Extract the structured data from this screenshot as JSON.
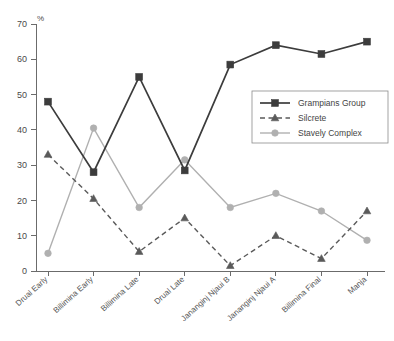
{
  "chart_data": {
    "type": "line",
    "title": "",
    "xlabel": "",
    "ylabel": "%",
    "ylim": [
      0,
      70
    ],
    "yticks": [
      0,
      10,
      20,
      30,
      40,
      50,
      60,
      70
    ],
    "grid": false,
    "legend_position": "center-right",
    "categories": [
      "Drual Early",
      "Billimina Early",
      "Billimina Late",
      "Drual Late",
      "Jananginj Njaui B",
      "Jananginj Njaui A",
      "Billimina Final",
      "Manja"
    ],
    "series": [
      {
        "name": "Grampians Group",
        "color": "#3c3c3c",
        "marker": "square",
        "dash": "solid",
        "values": [
          48,
          28,
          55,
          28.5,
          58.5,
          64,
          61.5,
          65
        ]
      },
      {
        "name": "Silcrete",
        "color": "#5a5a5a",
        "marker": "triangle",
        "dash": "dashed",
        "values": [
          33,
          20.5,
          5.5,
          15,
          1.5,
          10,
          3.5,
          17
        ]
      },
      {
        "name": "Stavely Complex",
        "color": "#b0b0b0",
        "marker": "circle",
        "dash": "solid",
        "values": [
          5,
          40.5,
          18,
          31.5,
          18,
          22,
          17,
          8.7
        ]
      }
    ]
  },
  "axis": {
    "unit_label": "%",
    "y_tick_labels": [
      "70",
      "60",
      "50",
      "40",
      "30",
      "20",
      "10",
      "0"
    ]
  },
  "legend": {
    "entries": [
      {
        "label": "Grampians Group"
      },
      {
        "label": "Silcrete"
      },
      {
        "label": "Stavely Complex"
      }
    ]
  }
}
